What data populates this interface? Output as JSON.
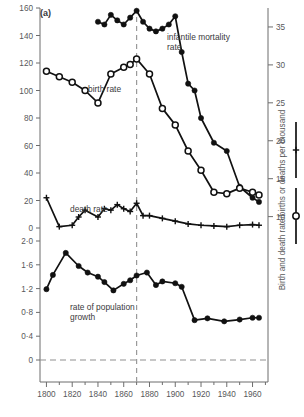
{
  "figure": {
    "panel_label": "(a)",
    "background": "#ffffff",
    "ink": "#111111",
    "axis_color": "#6d6d6d"
  },
  "axes": {
    "x": {
      "label": "",
      "ticks": [
        1800,
        1820,
        1840,
        1860,
        1880,
        1900,
        1920,
        1940,
        1960
      ],
      "minor_step": 10,
      "range": [
        1795,
        1972
      ]
    },
    "y_upper_left": {
      "label": "",
      "ticks": [
        0,
        20,
        40,
        60,
        80,
        100,
        120,
        140,
        160
      ],
      "range": [
        0,
        160
      ]
    },
    "y_lower_left": {
      "label": "",
      "ticks": [
        "0",
        "0·4",
        "0·8",
        "1·2",
        "1·6",
        "2·0"
      ],
      "tick_values": [
        0,
        0.4,
        0.8,
        1.2,
        1.6,
        2.0
      ],
      "range": [
        0,
        2.0
      ]
    },
    "y_right": {
      "label": "Birth and death rate/births or deaths per thousand",
      "ticks": [
        10,
        15,
        20,
        25,
        30,
        35
      ],
      "range": [
        8.5,
        37.5
      ]
    }
  },
  "annotations": {
    "infantile_mortality_label": "infantile mortality\nrate",
    "infantile_mortality_label_line1": "infantile mortality",
    "infantile_mortality_label_line2": "rate",
    "birth_rate_label": "birth rate",
    "death_rate_label": "death rate",
    "population_growth_label_line1": "rate of population",
    "population_growth_label_line2": "growth",
    "vertical_reference_year": 1870
  },
  "legend": {
    "items": [
      {
        "name": "death-rate-sample",
        "marker": "plus"
      },
      {
        "name": "birth-rate-sample",
        "marker": "open-circle"
      }
    ]
  },
  "chart_data": {
    "type": "line",
    "title": "(a)",
    "xlabel": "",
    "ylabel": "",
    "grid": false,
    "legend_position": "right",
    "xlim": [
      1795,
      1972
    ],
    "axes_note": "Left upper axis 0-160 (infantile mortality, per thousand births). Right axis 10-35 (birth and death rate per thousand). Lower left axis 0-2.0 (rate of population growth, % per year).",
    "series": [
      {
        "name": "infantile mortality rate",
        "axis": "left-upper",
        "marker": "filled-circle",
        "ylim": [
          0,
          160
        ],
        "x": [
          1840,
          1845,
          1850,
          1855,
          1860,
          1865,
          1870,
          1875,
          1880,
          1885,
          1890,
          1895,
          1900,
          1905,
          1910,
          1915,
          1920,
          1930,
          1940,
          1950,
          1960,
          1965
        ],
        "values": [
          150,
          148,
          155,
          151,
          148,
          153,
          158,
          150,
          145,
          143,
          145,
          148,
          154,
          128,
          105,
          100,
          80,
          62,
          56,
          30,
          22,
          19
        ]
      },
      {
        "name": "birth rate",
        "axis": "right",
        "marker": "open-circle",
        "ylim": [
          10,
          35
        ],
        "x": [
          1800,
          1810,
          1820,
          1830,
          1840,
          1850,
          1860,
          1865,
          1870,
          1880,
          1890,
          1900,
          1910,
          1920,
          1930,
          1940,
          1950,
          1960,
          1965
        ],
        "values_left_scale": [
          114,
          110,
          106,
          100,
          91,
          112,
          117,
          119,
          123,
          112,
          87,
          75,
          56,
          42,
          26,
          25,
          29,
          26,
          24
        ],
        "values": [
          33.0,
          32.4,
          31.8,
          30.9,
          29.5,
          32.8,
          33.5,
          33.9,
          34.5,
          32.8,
          28.9,
          27.0,
          24.2,
          21.5,
          16.0,
          15.7,
          17.3,
          16.0,
          15.8
        ]
      },
      {
        "name": "death rate",
        "axis": "right",
        "marker": "plus",
        "ylim": [
          10,
          35
        ],
        "x": [
          1800,
          1810,
          1820,
          1825,
          1830,
          1840,
          1845,
          1850,
          1855,
          1860,
          1865,
          1870,
          1875,
          1880,
          1890,
          1900,
          1910,
          1920,
          1930,
          1940,
          1950,
          1960,
          1965
        ],
        "values_left_scale": [
          22,
          1,
          2,
          8,
          13,
          8,
          14,
          13,
          17,
          14,
          12,
          18,
          9,
          9,
          7,
          5,
          3,
          2,
          1.5,
          1,
          2,
          2.5,
          2
        ],
        "values": [
          25.5,
          20.9,
          21.0,
          21.4,
          22.1,
          21.3,
          22.2,
          22.0,
          22.8,
          22.3,
          22.0,
          23.0,
          19.8,
          19.7,
          17.0,
          15.2,
          13.0,
          12.6,
          12.4,
          11.6,
          12.4,
          12.5,
          12.3
        ]
      },
      {
        "name": "rate of population growth",
        "axis": "lower-left",
        "marker": "filled-circle",
        "ylim": [
          0,
          2.0
        ],
        "x": [
          1800,
          1805,
          1815,
          1825,
          1832,
          1840,
          1845,
          1852,
          1860,
          1865,
          1870,
          1878,
          1885,
          1890,
          1900,
          1905,
          1915,
          1925,
          1938,
          1950,
          1960,
          1965
        ],
        "values": [
          1.19,
          1.43,
          1.8,
          1.58,
          1.47,
          1.4,
          1.31,
          1.17,
          1.28,
          1.34,
          1.42,
          1.47,
          1.26,
          1.32,
          1.29,
          1.23,
          0.67,
          0.7,
          0.65,
          0.68,
          0.71,
          0.71
        ]
      }
    ]
  }
}
